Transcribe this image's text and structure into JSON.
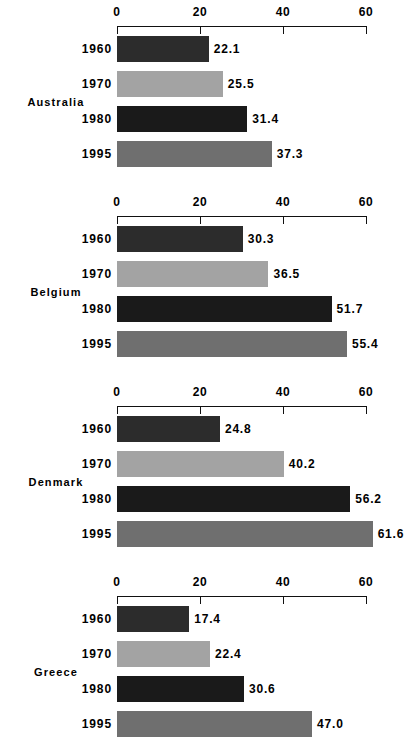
{
  "chart_data": {
    "type": "bar",
    "orientation": "horizontal",
    "title": "",
    "xlabel": "",
    "ylabel": "",
    "xlim": [
      0,
      60
    ],
    "xticks": [
      0,
      20,
      40,
      60
    ],
    "xtick_labels": [
      "0",
      "20",
      "40",
      "60"
    ],
    "grid": false,
    "legend": "none",
    "categories": [
      "1960",
      "1970",
      "1980",
      "1995"
    ],
    "panels": [
      {
        "name": "Australia",
        "categories": [
          "1960",
          "1970",
          "1980",
          "1995"
        ],
        "values": [
          22.1,
          25.5,
          31.4,
          37.3
        ],
        "value_labels": [
          "22.1",
          "25.5",
          "31.4",
          "37.3"
        ]
      },
      {
        "name": "Belgium",
        "categories": [
          "1960",
          "1970",
          "1980",
          "1995"
        ],
        "values": [
          30.3,
          36.5,
          51.7,
          55.4
        ],
        "value_labels": [
          "30.3",
          "36.5",
          "51.7",
          "55.4"
        ]
      },
      {
        "name": "Denmark",
        "categories": [
          "1960",
          "1970",
          "1980",
          "1995"
        ],
        "values": [
          24.8,
          40.2,
          56.2,
          61.6
        ],
        "value_labels": [
          "24.8",
          "40.2",
          "56.2",
          "61.6"
        ]
      },
      {
        "name": "Greece",
        "categories": [
          "1960",
          "1970",
          "1980",
          "1995"
        ],
        "values": [
          17.4,
          22.4,
          30.6,
          47.0
        ],
        "value_labels": [
          "17.4",
          "22.4",
          "30.6",
          "47.0"
        ]
      }
    ],
    "series_colors": {
      "1960": "#2c2c2c",
      "1970": "#a3a3a3",
      "1980": "#1a1a1a",
      "1995": "#6f6f6f"
    },
    "axis_color": "#111111"
  },
  "layout": {
    "plot_left_px": 117,
    "px_per_unit": 4.15,
    "panel_pitch_px": 190,
    "bar_height_px": 26,
    "row_pitch_px": 35,
    "first_row_offset_px": 36
  }
}
